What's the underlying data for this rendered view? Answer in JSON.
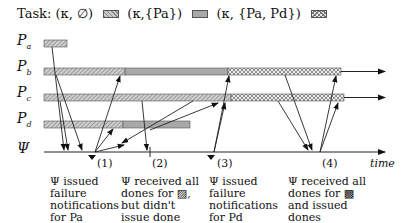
{
  "legend": {
    "prefix": "Task:",
    "items": [
      {
        "label": "(κ, ∅)",
        "pattern": "hatched"
      },
      {
        "label": "(κ,{Pa})",
        "pattern": "gray"
      },
      {
        "label": "(κ, {Pa, Pd})",
        "pattern": "crosshatch"
      }
    ]
  },
  "processes": [
    {
      "name": "P",
      "sub": "a"
    },
    {
      "name": "P",
      "sub": "b"
    },
    {
      "name": "P",
      "sub": "c"
    },
    {
      "name": "P",
      "sub": "d"
    },
    {
      "name": "Ψ",
      "sub": ""
    }
  ],
  "axis": {
    "label": "time"
  },
  "markers": [
    "(1)",
    "(2)",
    "(3)",
    "(4)"
  ],
  "notes": [
    {
      "lines": [
        "Ψ issued",
        "failure",
        "notifications",
        "for Pa"
      ]
    },
    {
      "lines": [
        "Ψ received all",
        "dones for ▨,",
        "but didn't",
        "issue done"
      ]
    },
    {
      "lines": [
        "Ψ issued",
        "failure",
        "notifications",
        "for Pd"
      ]
    },
    {
      "lines": [
        "Ψ received all",
        "dones for ▩",
        "and issued",
        "dones"
      ]
    }
  ],
  "colors": {
    "hatch": "#9a9a9a",
    "gray": "#a8a8a8",
    "cross": "#c8c8c8",
    "line": "#222222"
  }
}
